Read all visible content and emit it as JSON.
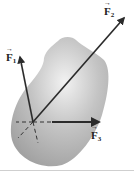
{
  "figure": {
    "body_color": "#a9a9a9",
    "arrow_color": "#2b2b2b",
    "intersection_point": {
      "x": 33,
      "y": 122
    },
    "forces": [
      {
        "name": "F1",
        "symbol": "F",
        "subscript": "1",
        "tip": {
          "x": 20,
          "y": 56
        }
      },
      {
        "name": "F2",
        "symbol": "F",
        "subscript": "2",
        "tip": {
          "x": 125,
          "y": 17
        }
      },
      {
        "name": "F3",
        "symbol": "F",
        "subscript": "3",
        "tip": {
          "x": 100,
          "y": 122
        }
      }
    ]
  }
}
